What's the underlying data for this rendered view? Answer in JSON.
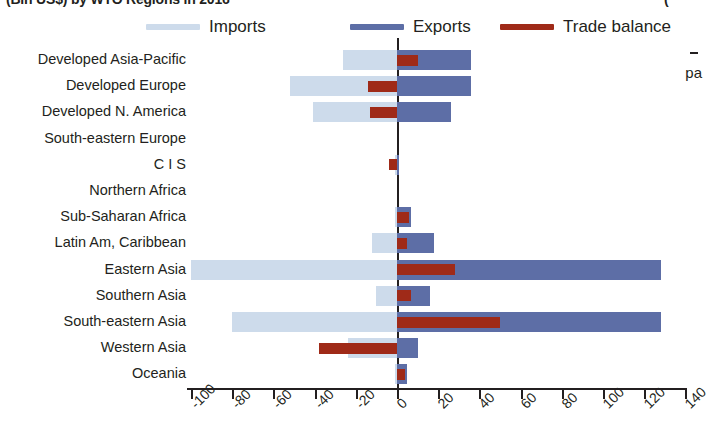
{
  "title": {
    "left_cropped": "(Bln US$) by WTO Regions in 2016",
    "right_cropped": "("
  },
  "side_fragment": "pa",
  "legend": {
    "position": "top",
    "items": [
      {
        "label": "Imports",
        "color": "#cddbeb",
        "icon": "legend-line-swatch"
      },
      {
        "label": "Exports",
        "color": "#5d6ea6",
        "icon": "legend-line-swatch"
      },
      {
        "label": "Trade balance",
        "color": "#9f2a18",
        "icon": "legend-line-swatch"
      }
    ]
  },
  "chart_data": {
    "type": "bar",
    "orientation": "horizontal",
    "title": "(Bln US$) by WTO Regions in 2016",
    "xlabel": "",
    "ylabel": "",
    "xlim": [
      -100,
      140
    ],
    "xticks": [
      -100,
      -80,
      -60,
      -40,
      -20,
      0,
      20,
      40,
      60,
      80,
      100,
      120,
      140
    ],
    "xtick_labels": [
      "-100",
      "-80",
      "-60",
      "-40",
      "-20",
      "0",
      "20",
      "40",
      "60",
      "80",
      "100",
      "120",
      "140"
    ],
    "grid": false,
    "zero_line": true,
    "legend_position": "top",
    "categories": [
      "Developed Asia-Pacific",
      "Developed Europe",
      "Developed N. America",
      "South-eastern Europe",
      "C I S",
      "Northern Africa",
      "Sub-Saharan Africa",
      "Latin Am, Caribbean",
      "Eastern Asia",
      "Southern Asia",
      "South-eastern Asia",
      "Western Asia",
      "Oceania"
    ],
    "series": [
      {
        "name": "Imports",
        "color": "#cddbeb",
        "values": [
          -26,
          -52,
          -41,
          0,
          -1,
          0,
          -1,
          -12,
          -100,
          -10,
          -80,
          -24,
          -1
        ]
      },
      {
        "name": "Exports",
        "color": "#5d6ea6",
        "values": [
          36,
          36,
          26,
          0,
          1,
          0,
          7,
          18,
          128,
          16,
          128,
          10,
          5
        ]
      },
      {
        "name": "Trade balance",
        "color": "#9f2a18",
        "values": [
          10,
          -14,
          -13,
          0,
          -4,
          0,
          6,
          5,
          28,
          7,
          50,
          -38,
          4
        ]
      }
    ]
  }
}
